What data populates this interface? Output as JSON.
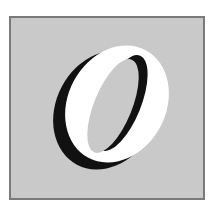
{
  "logo": {
    "letter": "O",
    "colors": {
      "background": "#ffffff",
      "frame_fill": "#c9c9c9",
      "frame_border": "#7a7a7a",
      "letter_fill": "#ffffff",
      "letter_shadow": "#111111"
    }
  }
}
